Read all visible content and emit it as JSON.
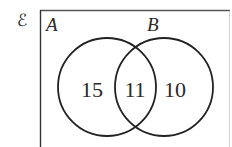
{
  "diagram": {
    "type": "venn",
    "universal_set": {
      "symbol": "ℰ"
    },
    "sets": [
      {
        "id": "A",
        "label": "A"
      },
      {
        "id": "B",
        "label": "B"
      }
    ],
    "regions": {
      "A_only": "15",
      "A_and_B": "11",
      "B_only": "10"
    },
    "colors": {
      "stroke": "#222222",
      "frame": "#444444",
      "frame_right": "#cfcfcf",
      "text": "#2a2a2a",
      "background": "#ffffff"
    }
  }
}
